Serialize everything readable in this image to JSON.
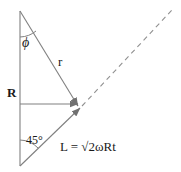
{
  "figure": {
    "background_color": "#ffffff",
    "line_color": "#808080",
    "text_color": "#1a1a1a",
    "width": 181,
    "height": 172
  },
  "labels": {
    "radius_R": "R",
    "angle_phi": "ϕ",
    "vector_r": "r",
    "angle_45": "45°",
    "equation": "L = √2ωRt"
  },
  "equation_parts": {
    "lhs": "L",
    "equals": "=",
    "radical": "√2",
    "omega": "ω",
    "R": "R",
    "t": "t"
  },
  "geometry": {
    "apex": [
      20,
      11
    ],
    "bottom_vertex": [
      20,
      166
    ],
    "convergence_point": [
      79,
      107
    ],
    "horizontal_y": 104,
    "dashed_end": [
      172,
      10
    ],
    "vertical_line": {
      "x": 20,
      "y1": 11,
      "y2": 166
    },
    "r_line": {
      "x1": 20,
      "y1": 11,
      "x2": 78,
      "y2": 106
    },
    "horizontal_line": {
      "x1": 20,
      "y1": 104,
      "x2": 78,
      "y2": 104
    },
    "diagonal_solid": {
      "x1": 20,
      "y1": 166,
      "x2": 81,
      "y2": 108
    },
    "diagonal_dashed": {
      "x1": 81,
      "y1": 108,
      "x2": 172,
      "y2": 10
    },
    "phi_arc": {
      "cx": 20,
      "cy": 11,
      "r": 26
    },
    "angle45_arc": {
      "cx": 20,
      "cy": 166,
      "r": 26
    }
  }
}
